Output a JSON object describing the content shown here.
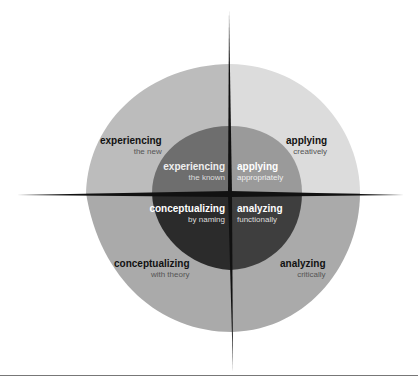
{
  "diagram": {
    "colors": {
      "outer_tl": "#bcbcbc",
      "outer_tr": "#dcdcdc",
      "outer_bottom": "#aaaaaa",
      "inner_tl": "#6e6e6e",
      "inner_tr": "#9a9a9a",
      "inner_bl": "#2b2b2b",
      "inner_br": "#3e3e3e",
      "axis": "#111111"
    },
    "outer": [
      {
        "title": "experiencing",
        "sub": "the new"
      },
      {
        "title": "applying",
        "sub": "creatively"
      },
      {
        "title": "conceptualizing",
        "sub": "with theory"
      },
      {
        "title": "analyzing",
        "sub": "critically"
      }
    ],
    "inner": [
      {
        "title": "experiencing",
        "sub": "the known"
      },
      {
        "title": "applying",
        "sub": "appropriately"
      },
      {
        "title": "conceptualizing",
        "sub": "by naming"
      },
      {
        "title": "analyzing",
        "sub": "functionally"
      }
    ]
  }
}
